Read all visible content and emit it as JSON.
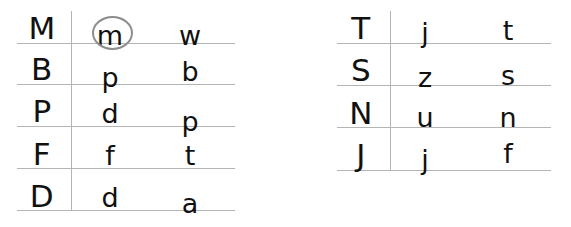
{
  "document": {
    "title": "Letter Matching Grid",
    "background_color": "#ffffff",
    "rule_color": "#b4b4b4",
    "glyph_color": "#111111",
    "annotation_color": "#8d8d8d"
  },
  "tables": [
    {
      "id": "left-table",
      "name": "left-letter-table",
      "columns": [
        "uppercase",
        "lowercase-written",
        "lowercase-target"
      ],
      "rows": [
        {
          "uppercase": "M",
          "lowercase_written": "m",
          "lowercase_target": "w",
          "annotated": true
        },
        {
          "uppercase": "B",
          "lowercase_written": "p",
          "lowercase_target": "b",
          "annotated": false
        },
        {
          "uppercase": "P",
          "lowercase_written": "d",
          "lowercase_target": "p",
          "annotated": false
        },
        {
          "uppercase": "F",
          "lowercase_written": "f",
          "lowercase_target": "t",
          "annotated": false
        },
        {
          "uppercase": "D",
          "lowercase_written": "d",
          "lowercase_target": "a",
          "annotated": false
        }
      ],
      "geometry": {
        "line_left": 17,
        "line_right": 235,
        "divider_x": 71,
        "divider_top": 11,
        "divider_bottom": 211,
        "baselines": [
          43,
          84,
          126,
          168,
          210
        ],
        "col_centers": [
          42,
          110,
          190
        ]
      }
    },
    {
      "id": "right-table",
      "name": "right-letter-table",
      "columns": [
        "uppercase",
        "lowercase-written",
        "lowercase-target"
      ],
      "rows": [
        {
          "uppercase": "T",
          "lowercase_written": "j",
          "lowercase_target": "t",
          "annotated": false
        },
        {
          "uppercase": "S",
          "lowercase_written": "z",
          "lowercase_target": "s",
          "annotated": false
        },
        {
          "uppercase": "N",
          "lowercase_written": "u",
          "lowercase_target": "n",
          "annotated": false
        },
        {
          "uppercase": "J",
          "lowercase_written": "j",
          "lowercase_target": "f",
          "annotated": false
        }
      ],
      "geometry": {
        "line_left": 337,
        "line_right": 551,
        "divider_x": 390,
        "divider_top": 11,
        "divider_bottom": 171,
        "baselines": [
          43,
          85,
          127,
          170
        ],
        "col_centers": [
          361,
          425,
          508
        ]
      }
    }
  ],
  "annotations": [
    {
      "name": "circled-letter-m",
      "target_letter": "m",
      "table": "left-table",
      "row": 1,
      "column": "lowercase-written",
      "shape": "ellipse",
      "x": 92,
      "y": 16,
      "width": 37,
      "height": 30,
      "color": "#8d8d8d"
    }
  ]
}
